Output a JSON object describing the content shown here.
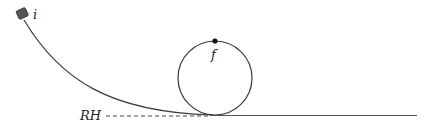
{
  "diagram": {
    "type": "roller-coaster loop",
    "labels": {
      "initial_point": "i",
      "final_point": "f",
      "reference_height": "RH"
    },
    "colors": {
      "line": "#3a3a3a",
      "cart": "#555555",
      "background": "#ffffff"
    }
  }
}
